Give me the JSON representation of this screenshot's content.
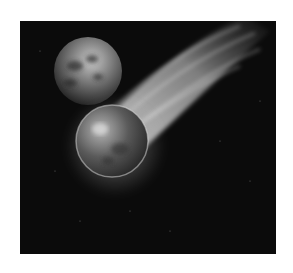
{
  "image": {
    "subject": "Flaming meteor with long glowing tail streaking past a planet in dark space",
    "style": "grayscale illustration",
    "colors": {
      "page_background": "#ffffff",
      "space_background": "#0b0b0b",
      "tail_highlight": "#f2f2f2",
      "planet_tone": "#8a8a8a",
      "meteor_tone": "#6e6e6e"
    },
    "elements": {
      "planet": "distant planet, upper-left",
      "meteor": "fiery sphere, center-left",
      "tail": "streaking flames toward upper-right",
      "stars": "faint specks scattered in background"
    }
  }
}
